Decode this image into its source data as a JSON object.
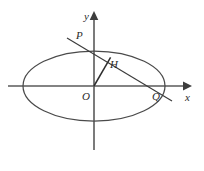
{
  "figure": {
    "kind": "analytic-geometry-ellipse-diagram",
    "background_color": "#ffffff",
    "ink_color": "#3a3a3a",
    "width": 204,
    "height": 171
  },
  "axes": {
    "x": {
      "label": "x",
      "label_x": 185,
      "label_y": 92,
      "start_x": 8,
      "end_x": 183,
      "y": 86,
      "arrow": "right"
    },
    "y": {
      "label": "y",
      "label_x": 84,
      "label_y": 11,
      "x": 94,
      "start_y": 150,
      "end_y": 16,
      "arrow": "up"
    }
  },
  "ellipse": {
    "center_x": 94,
    "center_y": 86,
    "rx": 71,
    "ry": 35
  },
  "secant": {
    "x1": 67,
    "y1": 38,
    "x2": 172,
    "y2": 101
  },
  "radius": {
    "x1": 94,
    "y1": 86,
    "x2": 110.6,
    "y2": 57.3
  },
  "points": [
    {
      "id": "P",
      "label": "P",
      "label_x": 76,
      "label_y": 30,
      "mark_x": 94,
      "mark_y": 47
    },
    {
      "id": "H",
      "label": "H",
      "label_x": 110,
      "label_y": 59,
      "mark_x": 110.6,
      "mark_y": 57.3
    },
    {
      "id": "O",
      "label": "O",
      "label_x": 82,
      "label_y": 91,
      "mark_x": 94,
      "mark_y": 86
    },
    {
      "id": "Q",
      "label": "Q",
      "label_x": 152,
      "label_y": 91,
      "mark_x": 157,
      "mark_y": 86
    }
  ]
}
